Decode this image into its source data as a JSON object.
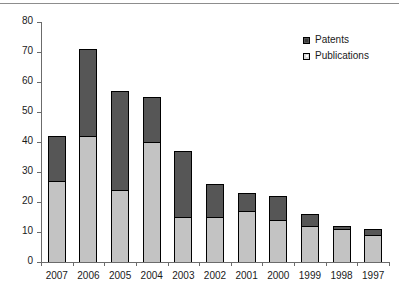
{
  "chart_data": {
    "type": "bar",
    "subtype": "stacked-vertical",
    "title": "",
    "subtitle": "",
    "xlabel": "",
    "ylabel": "",
    "ylim": [
      0,
      80
    ],
    "yticks": [
      0,
      10,
      20,
      30,
      40,
      50,
      60,
      70,
      80
    ],
    "ytick_labels": [
      "0",
      "10",
      "20",
      "30",
      "40",
      "50",
      "60",
      "70",
      "80"
    ],
    "grid": false,
    "legend_position": "top-right",
    "categories": [
      "2007",
      "2006",
      "2005",
      "2004",
      "2003",
      "2002",
      "2001",
      "2000",
      "1999",
      "1998",
      "1997"
    ],
    "series": [
      {
        "name": "Publications",
        "color": "#c3c3c3",
        "stack_order": 0,
        "values": [
          27,
          42,
          24,
          40,
          15,
          15,
          17,
          14,
          12,
          11,
          9
        ]
      },
      {
        "name": "Patents",
        "color": "#565656",
        "stack_order": 1,
        "values": [
          15,
          29,
          33,
          15,
          22,
          11,
          6,
          8,
          4,
          1,
          2
        ]
      }
    ],
    "totals": [
      42,
      71,
      57,
      55,
      37,
      26,
      23,
      22,
      16,
      12,
      11
    ]
  },
  "legend": {
    "items": [
      {
        "label": "Patents",
        "swatch": "patents-swatch-icon"
      },
      {
        "label": "Publications",
        "swatch": "publications-swatch-icon"
      }
    ]
  },
  "colors": {
    "patents": "#565656",
    "publications": "#c3c3c3",
    "axis": "#6b6b6b",
    "outline": "#000000",
    "background": "#ffffff",
    "text": "#1a1a1a"
  }
}
